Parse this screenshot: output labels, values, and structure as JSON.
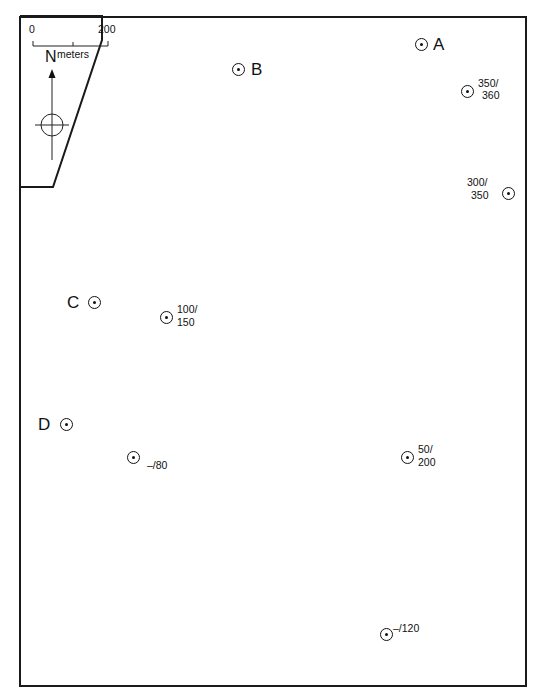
{
  "map": {
    "scale_bar": {
      "start_label": "0",
      "end_label": "200",
      "unit_label": "meters"
    },
    "north_arrow": {
      "label": "N"
    },
    "sites": [
      {
        "id": "A",
        "label": "A",
        "x": 421,
        "y": 44,
        "label_side": "right"
      },
      {
        "id": "B",
        "label": "B",
        "x": 238,
        "y": 69,
        "label_side": "right"
      },
      {
        "id": "C",
        "label": "C",
        "x": 94,
        "y": 302,
        "label_side": "left"
      },
      {
        "id": "D",
        "label": "D",
        "x": 66,
        "y": 424,
        "label_side": "left"
      }
    ],
    "readings": [
      {
        "line1": "350/",
        "line2": "360",
        "x": 467,
        "y": 91
      },
      {
        "line1": "300/",
        "line2": "350",
        "x": 509,
        "y": 193
      },
      {
        "line1": "100/",
        "line2": "150",
        "x": 166,
        "y": 317
      },
      {
        "line1": "–/80",
        "x": 133,
        "y": 457
      },
      {
        "line1": "50/",
        "line2": "200",
        "x": 407,
        "y": 457
      },
      {
        "line1": "–/120",
        "x": 386,
        "y": 634
      }
    ]
  }
}
